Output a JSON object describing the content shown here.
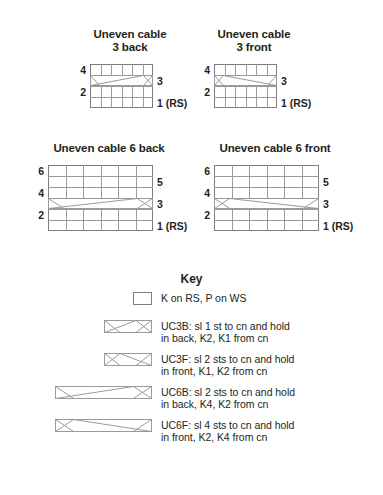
{
  "charts": [
    {
      "id": "uneven-cable-3-back",
      "title": "Uneven cable\n3 back",
      "stitches": 6,
      "rows": 4,
      "cable_row": 3,
      "cable_symbol": "UC3B",
      "left_labels": [
        {
          "row": 4,
          "text": "4"
        },
        {
          "row": 2,
          "text": "2"
        }
      ],
      "right_labels": [
        {
          "row": 3,
          "text": "3"
        },
        {
          "row": 1,
          "text": "1 (RS)"
        }
      ]
    },
    {
      "id": "uneven-cable-3-front",
      "title": "Uneven cable\n3 front",
      "stitches": 6,
      "rows": 4,
      "cable_row": 3,
      "cable_symbol": "UC3F",
      "left_labels": [
        {
          "row": 4,
          "text": "4"
        },
        {
          "row": 2,
          "text": "2"
        }
      ],
      "right_labels": [
        {
          "row": 3,
          "text": "3"
        },
        {
          "row": 1,
          "text": "1 (RS)"
        }
      ]
    },
    {
      "id": "uneven-cable-6-back",
      "title": "Uneven cable 6 back",
      "stitches": 6,
      "rows": 6,
      "cable_row": 3,
      "cable_symbol": "UC6B",
      "left_labels": [
        {
          "row": 6,
          "text": "6"
        },
        {
          "row": 4,
          "text": "4"
        },
        {
          "row": 2,
          "text": "2"
        }
      ],
      "right_labels": [
        {
          "row": 5,
          "text": "5"
        },
        {
          "row": 3,
          "text": "3"
        },
        {
          "row": 1,
          "text": "1 (RS)"
        }
      ]
    },
    {
      "id": "uneven-cable-6-front",
      "title": "Uneven cable 6 front",
      "stitches": 6,
      "rows": 6,
      "cable_row": 3,
      "cable_symbol": "UC6F",
      "left_labels": [
        {
          "row": 6,
          "text": "6"
        },
        {
          "row": 4,
          "text": "4"
        },
        {
          "row": 2,
          "text": "2"
        }
      ],
      "right_labels": [
        {
          "row": 5,
          "text": "5"
        },
        {
          "row": 3,
          "text": "3"
        },
        {
          "row": 1,
          "text": "1 (RS)"
        }
      ]
    }
  ],
  "key": {
    "title": "Key",
    "entries": [
      {
        "symbol": "plain",
        "label": "K on RS, P on WS"
      },
      {
        "symbol": "UC3B",
        "label": "UC3B: sl 1 st to cn and hold\nin back, K2, K1 from cn"
      },
      {
        "symbol": "UC3F",
        "label": "UC3F: sl 2 sts to cn and hold\nin front, K1, K2 from cn"
      },
      {
        "symbol": "UC6B",
        "label": "UC6B: sl 2 sts to cn and hold\nin back, K4, K2 from cn"
      },
      {
        "symbol": "UC6F",
        "label": "UC6F: sl 4 sts to cn and hold\nin front, K2, K4 from cn"
      }
    ]
  },
  "colors": {
    "ink": "#231f20",
    "grid_outer": "#7d7d80",
    "grid_inner": "#9a9a9d",
    "background": "#ffffff"
  }
}
